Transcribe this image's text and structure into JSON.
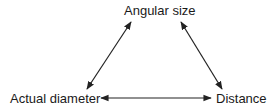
{
  "diagram": {
    "nodes": [
      {
        "id": "angular",
        "label": "Angular size"
      },
      {
        "id": "diameter",
        "label": "Actual diameter"
      },
      {
        "id": "distance",
        "label": "Distance"
      }
    ],
    "edges": [
      {
        "from": "diameter",
        "to": "angular",
        "type": "bidirectional"
      },
      {
        "from": "angular",
        "to": "distance",
        "type": "bidirectional"
      },
      {
        "from": "diameter",
        "to": "distance",
        "type": "bidirectional"
      }
    ],
    "line_color": "#222222"
  }
}
